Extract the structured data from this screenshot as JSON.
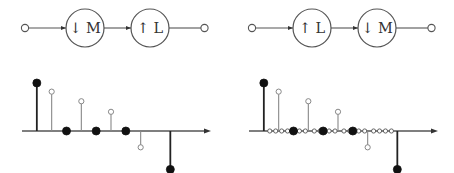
{
  "figure": {
    "width": 454,
    "height": 173,
    "background": "#ffffff",
    "stroke_color": "#555555",
    "marker_fill_color": "#111111",
    "marker_open_color": "#ffffff",
    "axis_color": "#555555"
  },
  "panels": [
    {
      "id": "left",
      "name": "decimate-then-interpolate",
      "diagram": {
        "input_terminal": "open-circle",
        "output_terminal": "open-circle",
        "blocks": [
          {
            "id": "block-1",
            "arrow": "↓",
            "factor": "M",
            "label": "↓ M"
          },
          {
            "id": "block-2",
            "arrow": "↑",
            "factor": "L",
            "label": "↑ L"
          }
        ],
        "connections": [
          "input→block-1",
          "block-1→block-2",
          "block-2→output"
        ]
      },
      "chart_data": {
        "type": "stem",
        "title": "",
        "xlabel": "",
        "ylabel": "",
        "grid": false,
        "legend": null,
        "xlim": [
          -1,
          11
        ],
        "ylim": [
          -1.15,
          1.15
        ],
        "baseline": 0,
        "samples": [
          {
            "n": 0,
            "value": 1.0,
            "marker": "filled"
          },
          {
            "n": 1,
            "value": 0.82,
            "marker": "open"
          },
          {
            "n": 2,
            "value": 0.0,
            "marker": "filled"
          },
          {
            "n": 3,
            "value": 0.62,
            "marker": "open"
          },
          {
            "n": 4,
            "value": 0.0,
            "marker": "filled"
          },
          {
            "n": 5,
            "value": 0.4,
            "marker": "open"
          },
          {
            "n": 6,
            "value": 0.0,
            "marker": "filled"
          },
          {
            "n": 7,
            "value": -0.34,
            "marker": "open"
          },
          {
            "n": 9,
            "value": -0.8,
            "marker": "filled"
          }
        ],
        "zero_markers": []
      }
    },
    {
      "id": "right",
      "name": "interpolate-then-decimate",
      "diagram": {
        "input_terminal": "open-circle",
        "output_terminal": "open-circle",
        "blocks": [
          {
            "id": "block-1",
            "arrow": "↑",
            "factor": "L",
            "label": "↑ L"
          },
          {
            "id": "block-2",
            "arrow": "↓",
            "factor": "M",
            "label": "↓ M"
          }
        ],
        "connections": [
          "input→block-1",
          "block-1→block-2",
          "block-2→output"
        ]
      },
      "chart_data": {
        "type": "stem",
        "title": "",
        "xlabel": "",
        "ylabel": "",
        "grid": false,
        "legend": null,
        "xlim": [
          -1,
          11
        ],
        "ylim": [
          -1.15,
          1.15
        ],
        "baseline": 0,
        "samples": [
          {
            "n": 0,
            "value": 1.0,
            "marker": "filled"
          },
          {
            "n": 1,
            "value": 0.82,
            "marker": "open"
          },
          {
            "n": 2,
            "value": 0.0,
            "marker": "filled"
          },
          {
            "n": 3,
            "value": 0.62,
            "marker": "open"
          },
          {
            "n": 4,
            "value": 0.0,
            "marker": "filled"
          },
          {
            "n": 5,
            "value": 0.4,
            "marker": "open"
          },
          {
            "n": 6,
            "value": 0.0,
            "marker": "filled"
          },
          {
            "n": 7,
            "value": -0.34,
            "marker": "open"
          },
          {
            "n": 9,
            "value": -0.8,
            "marker": "filled"
          }
        ],
        "zero_markers": [
          0.4,
          0.8,
          1.2,
          1.6,
          2.4,
          2.8,
          3.4,
          3.8,
          4.4,
          4.8,
          5.4,
          5.8,
          6.4,
          6.8,
          7.4,
          7.8,
          8.2,
          8.6
        ]
      }
    }
  ]
}
